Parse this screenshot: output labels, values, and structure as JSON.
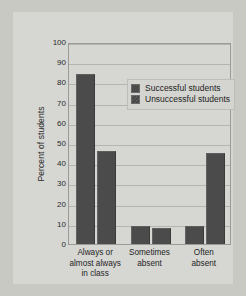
{
  "chart_data": {
    "type": "bar",
    "title": "",
    "xlabel": "",
    "ylabel": "Percent of students",
    "ylim": [
      0,
      100
    ],
    "ytick_step": 10,
    "grid": true,
    "legend_position": "upper-right-inside",
    "categories": [
      "Always or almost always in class",
      "Sometimes absent",
      "Often absent"
    ],
    "category_lines": [
      [
        "Always or",
        "almost always",
        "in class"
      ],
      [
        "Sometimes",
        "absent"
      ],
      [
        "Often",
        "absent"
      ]
    ],
    "yticks": [
      "100",
      "90",
      "80",
      "70",
      "60",
      "50",
      "40",
      "30",
      "20",
      "10",
      "0"
    ],
    "series": [
      {
        "name": "Successful students",
        "values": [
          84,
          9,
          9
        ],
        "color": "#4b4b4b"
      },
      {
        "name": "Unsuccessful students",
        "values": [
          46,
          8,
          45
        ],
        "color": "#4b4b4b"
      }
    ]
  },
  "legend": {
    "items": [
      {
        "label": "Successful students",
        "swatch": "legend-swatch-successful"
      },
      {
        "label": "Unsuccessful students",
        "swatch": "legend-swatch-unsuccessful"
      }
    ]
  },
  "colors": {
    "page_background": "#c9c9c4",
    "card_background": "#d6d6d2",
    "bar": "#4b4b4b",
    "gridline": "#b4b4b0",
    "frame": "#9a9a96",
    "text": "#1e1e1e"
  }
}
